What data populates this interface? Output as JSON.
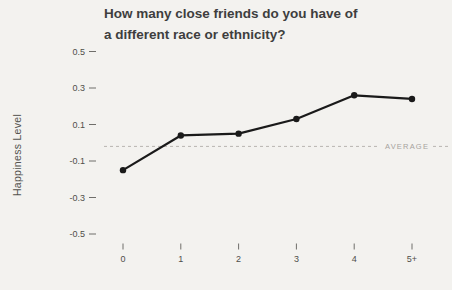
{
  "title": {
    "line1": "How many close friends do you have of",
    "line2": "a different race or ethnicity?"
  },
  "y_axis": {
    "label": "Happiness Level"
  },
  "chart_data": {
    "type": "line",
    "title": "How many close friends do you have of a different race or ethnicity?",
    "xlabel": "",
    "ylabel": "Happiness Level",
    "categories": [
      "0",
      "1",
      "2",
      "3",
      "4",
      "5+"
    ],
    "values": [
      -0.15,
      0.04,
      0.05,
      0.13,
      0.26,
      0.24
    ],
    "y_ticks": [
      0.5,
      0.3,
      0.1,
      -0.1,
      -0.3,
      -0.5
    ],
    "ylim": [
      -0.6,
      0.6
    ],
    "grid": false,
    "legend": "none",
    "average_line": {
      "value": -0.02,
      "label": "AVERAGE",
      "style": "dashed"
    },
    "colors": {
      "line": "#1a1a1a",
      "point": "#1a1a1a",
      "average": "#b8b5b0",
      "average_text": "#a6a39e",
      "tick": "#6f6e6a",
      "background": "#f3f2ef"
    }
  }
}
